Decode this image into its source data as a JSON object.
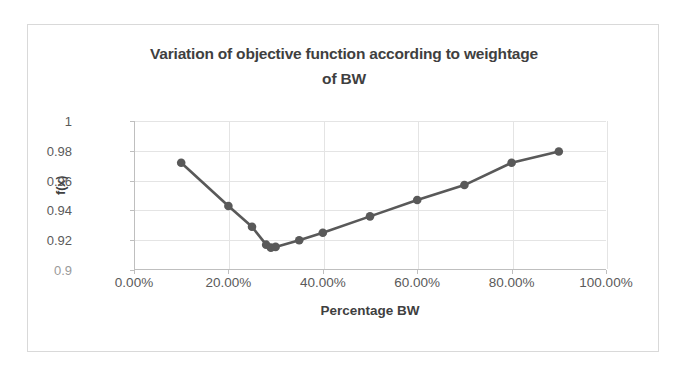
{
  "figure": {
    "background_color": "#ffffff",
    "border_color": "#d9d9d9"
  },
  "chart_data": {
    "type": "line",
    "title": "Variation of objective function according to weightage of BW",
    "title_line_1": "Variation of objective function according to weightage",
    "title_line_2": "of BW",
    "xlabel": "Percentage BW",
    "ylabel": "f(x)",
    "xlim": [
      0,
      100
    ],
    "ylim": [
      0.9,
      1
    ],
    "grid": true,
    "legend": "none",
    "series_color": "#595959",
    "marker": "circle",
    "x_tick_labels": [
      "0.00%",
      "20.00%",
      "40.00%",
      "60.00%",
      "80.00%",
      "100.00%"
    ],
    "x_tick_values": [
      0,
      20,
      40,
      60,
      80,
      100
    ],
    "y_tick_labels": [
      "0.9",
      "0.92",
      "0.94",
      "0.96",
      "0.98",
      "1"
    ],
    "y_tick_values": [
      0.9,
      0.92,
      0.94,
      0.96,
      0.98,
      1
    ],
    "x": [
      10,
      20,
      25,
      28,
      29,
      30,
      35,
      40,
      50,
      60,
      70,
      80,
      90
    ],
    "values": [
      0.972,
      0.943,
      0.929,
      0.917,
      0.915,
      0.9155,
      0.92,
      0.925,
      0.936,
      0.947,
      0.957,
      0.972,
      0.9795
    ],
    "points": [
      {
        "x": 10,
        "y": 0.972
      },
      {
        "x": 20,
        "y": 0.943
      },
      {
        "x": 25,
        "y": 0.929
      },
      {
        "x": 28,
        "y": 0.917
      },
      {
        "x": 29,
        "y": 0.915
      },
      {
        "x": 30,
        "y": 0.9155
      },
      {
        "x": 35,
        "y": 0.92
      },
      {
        "x": 40,
        "y": 0.925
      },
      {
        "x": 50,
        "y": 0.936
      },
      {
        "x": 60,
        "y": 0.947
      },
      {
        "x": 70,
        "y": 0.957
      },
      {
        "x": 80,
        "y": 0.972
      },
      {
        "x": 90,
        "y": 0.9795
      }
    ]
  }
}
